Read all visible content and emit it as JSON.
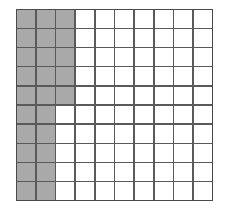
{
  "figure": {
    "kind": "shaded-grid",
    "background_color": "#ffffff",
    "grid_line_color": "#5a5a5a",
    "border_color": "#4a4a4a",
    "shaded_cell_color": "#a9a9a9",
    "empty_cell_color": "#ffffff"
  },
  "chart_data": {
    "type": "heatmap",
    "title": "",
    "subtitle": "",
    "xlabel": "",
    "ylabel": "",
    "legend": [],
    "annotations": [],
    "grid": true,
    "rows": 10,
    "columns": 10,
    "row_labels": [
      "1",
      "2",
      "3",
      "4",
      "5",
      "6",
      "7",
      "8",
      "9",
      "10"
    ],
    "column_labels": [
      "1",
      "2",
      "3",
      "4",
      "5",
      "6",
      "7",
      "8",
      "9",
      "10"
    ],
    "value_legend": {
      "0": "unshaded",
      "1": "shaded"
    },
    "shaded_count": 25,
    "total_cells": 100,
    "shaded_fraction": "25/100",
    "shaded_per_row": [
      3,
      3,
      3,
      3,
      3,
      2,
      2,
      2,
      2,
      2
    ],
    "shaded_per_column": [
      10,
      10,
      5,
      0,
      0,
      0,
      0,
      0,
      0,
      0
    ],
    "values": [
      [
        1,
        1,
        1,
        0,
        0,
        0,
        0,
        0,
        0,
        0
      ],
      [
        1,
        1,
        1,
        0,
        0,
        0,
        0,
        0,
        0,
        0
      ],
      [
        1,
        1,
        1,
        0,
        0,
        0,
        0,
        0,
        0,
        0
      ],
      [
        1,
        1,
        1,
        0,
        0,
        0,
        0,
        0,
        0,
        0
      ],
      [
        1,
        1,
        1,
        0,
        0,
        0,
        0,
        0,
        0,
        0
      ],
      [
        1,
        1,
        0,
        0,
        0,
        0,
        0,
        0,
        0,
        0
      ],
      [
        1,
        1,
        0,
        0,
        0,
        0,
        0,
        0,
        0,
        0
      ],
      [
        1,
        1,
        0,
        0,
        0,
        0,
        0,
        0,
        0,
        0
      ],
      [
        1,
        1,
        0,
        0,
        0,
        0,
        0,
        0,
        0,
        0
      ],
      [
        1,
        1,
        0,
        0,
        0,
        0,
        0,
        0,
        0,
        0
      ]
    ]
  }
}
